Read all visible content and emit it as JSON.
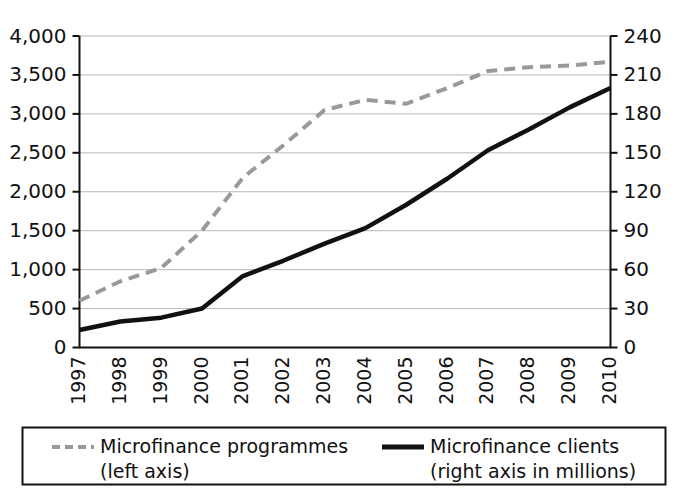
{
  "chart_data": {
    "type": "line",
    "title": "",
    "subtitle": "",
    "xlabel": "",
    "ylabel": "",
    "y2label": "",
    "grid": true,
    "legend_position": "bottom",
    "x": [
      "1997",
      "1998",
      "1999",
      "2000",
      "2001",
      "2002",
      "2003",
      "2004",
      "2005",
      "2006",
      "2007",
      "2008",
      "2009",
      "2010"
    ],
    "categories": [
      "1997",
      "1998",
      "1999",
      "2000",
      "2001",
      "2002",
      "2003",
      "2004",
      "2005",
      "2006",
      "2007",
      "2008",
      "2009",
      "2010"
    ],
    "ylim": [
      0,
      4000
    ],
    "y2lim": [
      0,
      240
    ],
    "yticks": [
      "0",
      "500",
      "1,000",
      "1,500",
      "2,000",
      "2,500",
      "3,000",
      "3,500",
      "4,000"
    ],
    "ytick_values": [
      0,
      500,
      1000,
      1500,
      2000,
      2500,
      3000,
      3500,
      4000
    ],
    "y2ticks": [
      "0",
      "30",
      "60",
      "90",
      "120",
      "150",
      "180",
      "210",
      "240"
    ],
    "y2tick_values": [
      0,
      30,
      60,
      90,
      120,
      150,
      180,
      210,
      240
    ],
    "series": [
      {
        "name": "Microfinance programmes",
        "axis": "left",
        "style": "dashed",
        "color": "#999999",
        "legend_label_line1": "Microfinance programmes",
        "legend_label_line2": "(left axis)",
        "values": [
          600,
          850,
          1020,
          1500,
          2180,
          2600,
          3050,
          3180,
          3130,
          3330,
          3550,
          3600,
          3620,
          3670
        ]
      },
      {
        "name": "Microfinance clients",
        "axis": "right",
        "style": "solid",
        "color": "#111111",
        "legend_label_line1": "Microfinance clients",
        "legend_label_line2": "(right axis in millions)",
        "values": [
          13.5,
          20,
          23,
          30,
          55,
          67,
          80,
          92,
          110,
          130,
          152,
          168,
          185,
          200
        ]
      }
    ]
  },
  "legend": {
    "entries": [
      {
        "marker": "dashed-line-marker",
        "line1": "Microfinance programmes",
        "line2": "(left axis)"
      },
      {
        "marker": "solid-line-marker",
        "line1": "Microfinance clients",
        "line2": "(right axis in millions)"
      }
    ]
  },
  "colors": {
    "programmes": "#999999",
    "clients": "#111111",
    "grid": "#b8b8b8",
    "axis": "#111111",
    "background": "#ffffff"
  }
}
